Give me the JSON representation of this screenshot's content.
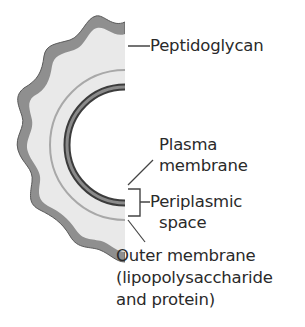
{
  "figure": {
    "labels": {
      "peptidoglycan": "Peptidoglycan",
      "plasma_membrane_line1": "Plasma",
      "plasma_membrane_line2": "membrane",
      "periplasmic_line1": "Periplasmic",
      "periplasmic_line2": "space",
      "outer_line1": "Outer membrane",
      "outer_line2": "(lipopolysaccharide",
      "outer_line3": "and protein)"
    },
    "colors": {
      "outer_membrane": "#8f8f8f",
      "outer_membrane_edge": "#5a5a5a",
      "periplasm_fill": "#e9e9e9",
      "peptidoglycan": "#a8a8a8",
      "plasma_membrane": "#7a7a7a",
      "plasma_membrane_edge": "#3c3c3c",
      "text": "#2a2a2a"
    }
  }
}
